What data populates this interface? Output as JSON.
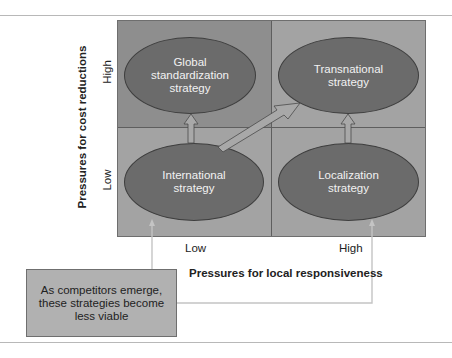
{
  "diagram": {
    "quadrants": {
      "top_left": {
        "label": "Global standardization strategy",
        "lines": [
          "Global",
          "standardization",
          "strategy"
        ]
      },
      "top_right": {
        "label": "Transnational strategy",
        "lines": [
          "Transnational",
          "strategy"
        ]
      },
      "bottom_left": {
        "label": "International strategy",
        "lines": [
          "International",
          "strategy"
        ]
      },
      "bottom_right": {
        "label": "Localization strategy",
        "lines": [
          "Localization",
          "strategy"
        ]
      }
    },
    "y_axis": {
      "title": "Pressures for cost reductions",
      "high": "High",
      "low": "Low"
    },
    "x_axis": {
      "title": "Pressures for local responsiveness",
      "low": "Low",
      "high": "High"
    },
    "callout": {
      "text": "As competitors emerge, these strategies become less viable",
      "lines": [
        "As competitors emerge,",
        "these strategies become",
        "less viable"
      ]
    },
    "arrows": [
      {
        "from": "International strategy",
        "to": "Global standardization strategy"
      },
      {
        "from": "International strategy",
        "to": "Transnational strategy"
      },
      {
        "from": "Localization strategy",
        "to": "Transnational strategy"
      }
    ],
    "colors": {
      "quadrant_dark": "#8e8e8e",
      "quadrant_light": "#a3a3a3",
      "ellipse_fill": "#6b6b6b",
      "callout_fill": "#b1b1b1",
      "arrow_fill": "#a8a8a8"
    }
  }
}
